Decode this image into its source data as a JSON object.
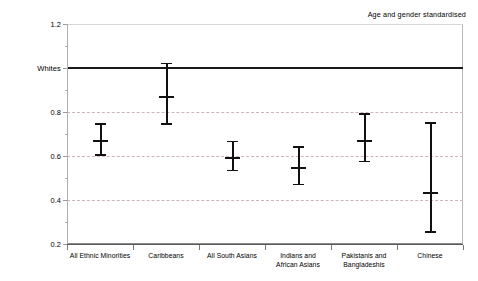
{
  "annotation": {
    "text": "Age and gender standardised"
  },
  "axes": {
    "y": {
      "ticks": [
        {
          "value": 1.2,
          "label": "1.2"
        },
        {
          "value": 1.0,
          "label": "Whites"
        },
        {
          "value": 0.8,
          "label": "0.8"
        },
        {
          "value": 0.6,
          "label": "0.6"
        },
        {
          "value": 0.4,
          "label": "0.4"
        },
        {
          "value": 0.2,
          "label": "0.2"
        }
      ],
      "min": 0.2,
      "max": 1.2
    },
    "x": {
      "categories": [
        "All Ethnic Minorities",
        "Caribbeans",
        "All South Asians",
        "Indians and\nAfrican Asians",
        "Pakistanis and\nBangladeshis",
        "Chinese"
      ]
    }
  },
  "chart_data": {
    "type": "scatter",
    "title": "",
    "subtitle": "",
    "annotations": [
      "Age and gender standardised"
    ],
    "xlabel": "",
    "ylabel": "",
    "ylim": [
      0.2,
      1.2
    ],
    "yticks": [
      0.2,
      0.4,
      0.6,
      0.8,
      1.0,
      1.2
    ],
    "ytick_labels": [
      "0.2",
      "0.4",
      "0.6",
      "0.8",
      "Whites",
      "1.2"
    ],
    "grid": true,
    "grid_axis": "y",
    "legend": null,
    "reference_line": {
      "label": "Whites",
      "value": 1.0
    },
    "categories": [
      "All Ethnic Minorities",
      "Caribbeans",
      "All South Asians",
      "Indians and African Asians",
      "Pakistanis and Bangladeshis",
      "Chinese"
    ],
    "values": [
      0.67,
      0.87,
      0.59,
      0.545,
      0.67,
      0.435
    ],
    "error_low": [
      0.605,
      0.745,
      0.535,
      0.47,
      0.575,
      0.255
    ],
    "error_high": [
      0.745,
      1.02,
      0.665,
      0.64,
      0.79,
      0.75
    ],
    "points": [
      {
        "category": "All Ethnic Minorities",
        "estimate": 0.67,
        "ci_low": 0.605,
        "ci_high": 0.745
      },
      {
        "category": "Caribbeans",
        "estimate": 0.87,
        "ci_low": 0.745,
        "ci_high": 1.02
      },
      {
        "category": "All South Asians",
        "estimate": 0.59,
        "ci_low": 0.535,
        "ci_high": 0.665
      },
      {
        "category": "Indians and African Asians",
        "estimate": 0.545,
        "ci_low": 0.47,
        "ci_high": 0.64
      },
      {
        "category": "Pakistanis and Bangladeshis",
        "estimate": 0.67,
        "ci_low": 0.575,
        "ci_high": 0.79
      },
      {
        "category": "Chinese",
        "estimate": 0.435,
        "ci_low": 0.255,
        "ci_high": 0.75
      }
    ]
  },
  "colors": {
    "marker": "#111111",
    "reference_line": "#1a1a1a",
    "gridline": "#c9b6b6",
    "axis": "#7a7a7a",
    "background": "#ffffff"
  }
}
